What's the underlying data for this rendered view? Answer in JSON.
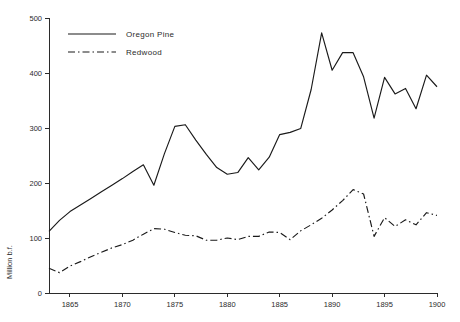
{
  "chart_data": {
    "type": "line",
    "title": "",
    "xlabel": "",
    "ylabel": "Million b.f.",
    "xlim": [
      1863,
      1900
    ],
    "ylim": [
      0,
      500
    ],
    "grid": false,
    "legend_position": "top-left",
    "x": [
      1863,
      1864,
      1865,
      1866,
      1867,
      1868,
      1869,
      1870,
      1871,
      1872,
      1873,
      1874,
      1875,
      1876,
      1877,
      1878,
      1879,
      1880,
      1881,
      1882,
      1883,
      1884,
      1885,
      1886,
      1887,
      1888,
      1889,
      1890,
      1891,
      1892,
      1893,
      1894,
      1895,
      1896,
      1897,
      1898,
      1899,
      1900
    ],
    "xticks": [
      1865,
      1870,
      1875,
      1880,
      1885,
      1890,
      1895,
      1900
    ],
    "xticklabels": [
      "1865",
      "1870",
      "1875",
      "1880",
      "1885",
      "1890",
      "1895",
      "1900"
    ],
    "yticks": [
      0,
      100,
      200,
      300,
      400,
      500
    ],
    "yticklabels": [
      "0",
      "100",
      "200",
      "300",
      "400",
      "500"
    ],
    "series": [
      {
        "name": "Oregon Pine",
        "style": "solid",
        "values": [
          112,
          132,
          148,
          160,
          172,
          184,
          196,
          208,
          221,
          233,
          196,
          253,
          303,
          306,
          278,
          252,
          228,
          216,
          219,
          246,
          224,
          247,
          288,
          292,
          299,
          370,
          473,
          405,
          437,
          437,
          393,
          318,
          392,
          362,
          372,
          335,
          396,
          375
        ]
      },
      {
        "name": "Redwood",
        "style": "dash-dot",
        "values": [
          45,
          37,
          49,
          57,
          66,
          74,
          82,
          88,
          96,
          107,
          117,
          116,
          110,
          105,
          104,
          96,
          96,
          100,
          97,
          103,
          103,
          111,
          110,
          97,
          113,
          124,
          136,
          151,
          168,
          188,
          180,
          103,
          137,
          121,
          133,
          124,
          146,
          141
        ]
      }
    ]
  },
  "legend": {
    "items": [
      {
        "label": "Oregon Pine",
        "style": "solid"
      },
      {
        "label": "Redwood",
        "style": "dash-dot"
      }
    ]
  }
}
